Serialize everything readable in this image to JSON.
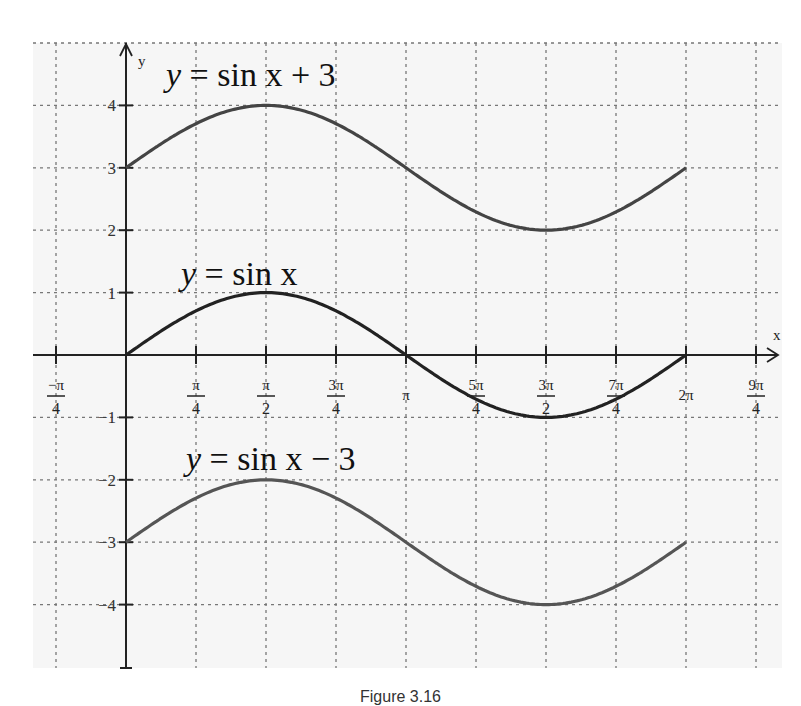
{
  "chart_data": {
    "type": "line",
    "title": "",
    "xlabel": "x",
    "ylabel": "y",
    "xlim": [
      -0.785398,
      7.068583
    ],
    "ylim": [
      -4.5,
      4.5
    ],
    "grid": true,
    "x_ticks": [
      {
        "value": -0.785398,
        "num": "−π",
        "den": "4"
      },
      {
        "value": 0.785398,
        "num": "π",
        "den": "4"
      },
      {
        "value": 1.570796,
        "num": "π",
        "den": "2"
      },
      {
        "value": 2.356194,
        "num": "3π",
        "den": "4"
      },
      {
        "value": 3.141593,
        "num": "π",
        "den": ""
      },
      {
        "value": 3.926991,
        "num": "5π",
        "den": "4"
      },
      {
        "value": 4.712389,
        "num": "3π",
        "den": "2"
      },
      {
        "value": 5.497787,
        "num": "7π",
        "den": "4"
      },
      {
        "value": 6.283185,
        "num": "2π",
        "den": ""
      },
      {
        "value": 7.068583,
        "num": "9π",
        "den": "4"
      }
    ],
    "y_ticks": [
      4,
      3,
      2,
      1,
      -1,
      -2,
      -3,
      -4
    ],
    "series": [
      {
        "name": "y = sin x + 3",
        "label_lhs": "y",
        "label_rhs": "sin x + 3",
        "offset": 3,
        "x": [
          0,
          0.785398,
          1.570796,
          2.356194,
          3.141593,
          3.926991,
          4.712389,
          5.497787,
          6.283185
        ],
        "values": [
          3,
          3.71,
          4,
          3.71,
          3,
          2.29,
          2,
          2.29,
          3
        ]
      },
      {
        "name": "y = sin x",
        "label_lhs": "y",
        "label_rhs": "sin x",
        "offset": 0,
        "x": [
          0,
          0.785398,
          1.570796,
          2.356194,
          3.141593,
          3.926991,
          4.712389,
          5.497787,
          6.283185
        ],
        "values": [
          0,
          0.71,
          1,
          0.71,
          0,
          -0.71,
          -1,
          -0.71,
          0
        ]
      },
      {
        "name": "y = sin x − 3",
        "label_lhs": "y",
        "label_rhs": "sin x − 3",
        "offset": -3,
        "x": [
          0,
          0.785398,
          1.570796,
          2.356194,
          3.141593,
          3.926991,
          4.712389,
          5.497787,
          6.283185
        ],
        "values": [
          -3,
          -2.29,
          -2,
          -2.29,
          -3,
          -3.71,
          -4,
          -3.71,
          -3
        ]
      }
    ],
    "annotations": [
      {
        "text": "y = sin x + 3",
        "series": 0
      },
      {
        "text": "y = sin x",
        "series": 1
      },
      {
        "text": "y = sin x − 3",
        "series": 2
      }
    ]
  },
  "caption": "Figure 3.16"
}
